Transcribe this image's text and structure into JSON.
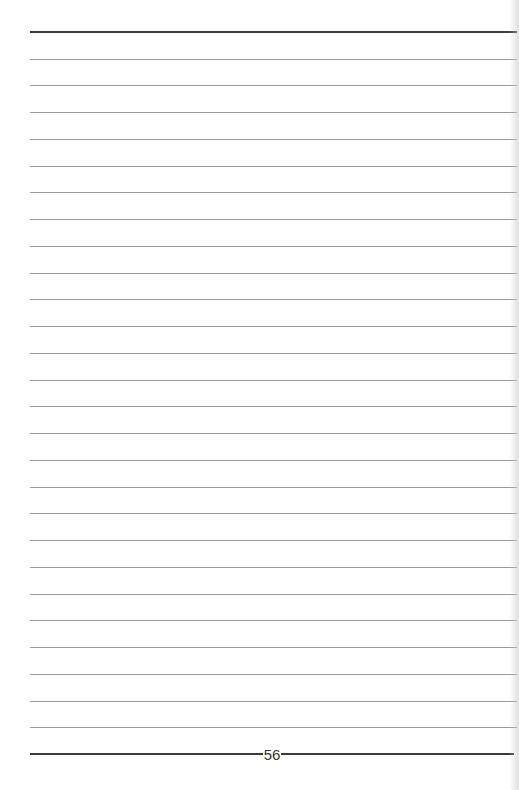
{
  "page": {
    "type": "lined-notes-page",
    "page_number": "56",
    "rule_count": 26,
    "colors": {
      "thin_rule": "#9a9a9a",
      "thick_rule": "#3c3c3c",
      "background": "#ffffff"
    }
  }
}
